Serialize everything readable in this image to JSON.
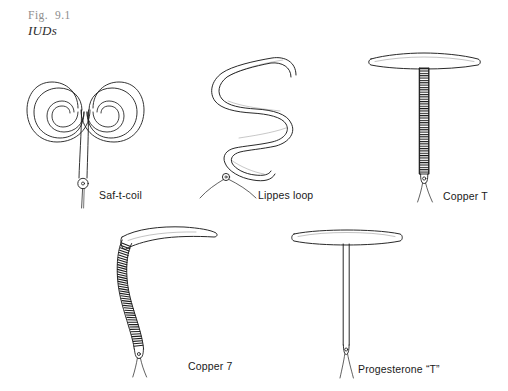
{
  "figure": {
    "number": "Fig.  9.1",
    "title": "IUDs",
    "caption_color": "#8d8d8d",
    "ink_color": "#1a1a1a",
    "background_color": "#ffffff"
  },
  "devices": [
    {
      "id": "saf-t-coil",
      "label": "Saf-t-coil",
      "description": "double-spiral coil with central stem, ring and single retrieval string",
      "has_copper_coil": false,
      "row": 1,
      "column": 1
    },
    {
      "id": "lippes-loop",
      "label": "Lippes loop",
      "description": "serpentine double-S trapezoid loop with two retrieval strings",
      "has_copper_coil": false,
      "row": 1,
      "column": 2
    },
    {
      "id": "copper-t",
      "label": "Copper T",
      "description": "T-shaped frame with copper wire wound around vertical stem",
      "has_copper_coil": true,
      "row": 1,
      "column": 3
    },
    {
      "id": "copper-7",
      "label": "Copper 7",
      "description": "seven-shaped frame with copper wire wound around curved stem",
      "has_copper_coil": true,
      "row": 2,
      "column": 1
    },
    {
      "id": "progesterone-t",
      "label": "Progesterone “T”",
      "description": "plain T-shaped frame with hormone reservoir stem",
      "has_copper_coil": false,
      "row": 2,
      "column": 2
    }
  ]
}
